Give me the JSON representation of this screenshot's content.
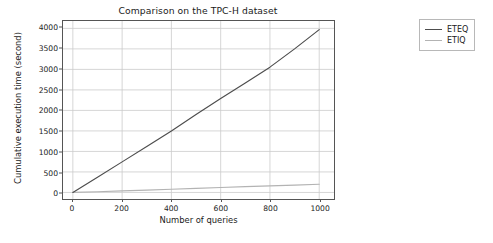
{
  "chart_data": {
    "type": "line",
    "title": "Comparison on the TPC-H dataset",
    "xlabel": "Number of queries",
    "ylabel": "Cumulative execution time (second)",
    "xlim": [
      -40,
      1060
    ],
    "ylim": [
      -160,
      4180
    ],
    "xticks": [
      0,
      200,
      400,
      600,
      800,
      1000
    ],
    "xtick_labels": [
      "0",
      "200",
      "400",
      "600",
      "800",
      "1000"
    ],
    "yticks": [
      0,
      500,
      1000,
      1500,
      2000,
      2500,
      3000,
      3500,
      4000
    ],
    "ytick_labels": [
      "0",
      "500",
      "1000",
      "1500",
      "2000",
      "2500",
      "3000",
      "3500",
      "4000"
    ],
    "grid": true,
    "legend_position": "outside-right-top",
    "x": [
      0,
      100,
      200,
      300,
      400,
      500,
      600,
      700,
      800,
      900,
      1000
    ],
    "series": [
      {
        "name": "ETEQ",
        "color": "#4d4d4d",
        "values": [
          0,
          370,
          745,
          1120,
          1500,
          1900,
          2290,
          2670,
          3055,
          3500,
          3970
        ]
      },
      {
        "name": "ETIQ",
        "color": "#b3b3b3",
        "values": [
          0,
          18,
          38,
          58,
          78,
          98,
          120,
          140,
          160,
          180,
          200
        ]
      }
    ]
  },
  "legend": {
    "entries": [
      {
        "label": "ETEQ",
        "color": "#4d4d4d"
      },
      {
        "label": "ETIQ",
        "color": "#b3b3b3"
      }
    ]
  },
  "colors": {
    "background": "#ffffff",
    "axis": "#555555",
    "grid": "#cccccc",
    "text": "#1a1a1a",
    "legend_border": "#b8b8b8"
  }
}
